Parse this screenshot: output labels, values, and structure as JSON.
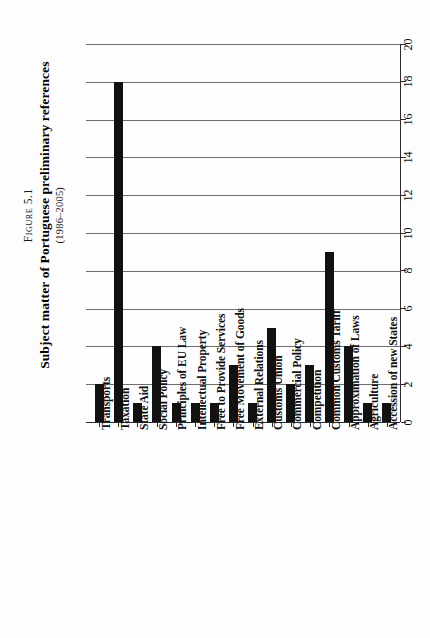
{
  "figure": {
    "label": "Figure 5.1",
    "title": "Subject matter of Portuguese preliminary references",
    "subtitle": "(1986–2005)"
  },
  "chart_data": {
    "type": "bar",
    "title": "Subject matter of Portuguese preliminary references",
    "subtitle": "(1986–2005)",
    "figure_label": "Figure 5.1",
    "orientation": "vertical-bars-rotated-page",
    "xlabel": "",
    "ylabel": "",
    "ylim": [
      0,
      20
    ],
    "yticks": [
      0,
      2,
      4,
      6,
      8,
      10,
      12,
      14,
      16,
      18,
      20
    ],
    "ytick_labels": [
      "0",
      "2",
      "4",
      "6",
      "8",
      "10",
      "12",
      "14",
      "16",
      "18",
      "20"
    ],
    "grid": true,
    "legend": false,
    "bar_color": "#111111",
    "categories": [
      "Transports",
      "Taxation",
      "State Aid",
      "Social Policy",
      "Principles of EU Law",
      "Intellectual Property",
      "Free to Provide Services",
      "Free Movement of Goods",
      "External Relations",
      "Customs Union",
      "Commercial Policy",
      "Competition",
      "Common Customs Tariff",
      "Approximation of Laws",
      "Agriculture",
      "Accession of new States"
    ],
    "values": [
      2,
      18,
      1,
      4,
      1,
      1,
      1,
      3,
      1,
      5,
      2,
      3,
      9,
      4,
      1,
      1
    ]
  }
}
